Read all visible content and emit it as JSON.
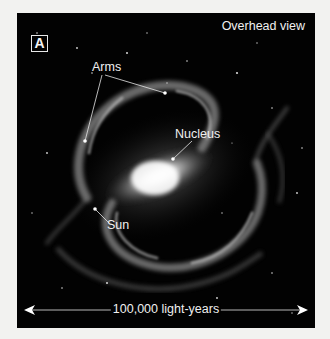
{
  "figure": {
    "panel_label": "A",
    "view_title": "Overhead view",
    "labels": {
      "arms": "Arms",
      "nucleus": "Nucleus",
      "sun": "Sun"
    },
    "scale_bar": {
      "text": "100,000 light-years"
    },
    "colors": {
      "background": "#020202",
      "page": "#f2f2f0",
      "text": "#f0f0f0"
    }
  }
}
